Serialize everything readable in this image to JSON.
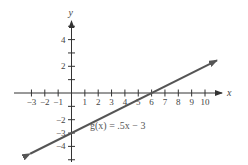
{
  "chart_data": {
    "type": "line",
    "title": "",
    "xlabel": "x",
    "ylabel": "y",
    "xlim": [
      -3.5,
      11.3
    ],
    "ylim": [
      -5.2,
      5.4
    ],
    "grid": false,
    "x_ticks": [
      -3,
      -2,
      -1,
      1,
      2,
      3,
      4,
      5,
      6,
      7,
      8,
      9,
      10
    ],
    "x_tick_labels": [
      "−3",
      "−2",
      "−1",
      "1",
      "2",
      "3",
      "4",
      "5",
      "6",
      "7",
      "8",
      "9",
      "10"
    ],
    "y_ticks": [
      5,
      4,
      3,
      2,
      1,
      -1,
      -2,
      -3,
      -4,
      -5
    ],
    "y_tick_labels": [
      {
        "value": 4,
        "label": "4"
      },
      {
        "value": 2,
        "label": "2"
      },
      {
        "value": -2,
        "label": "−2"
      },
      {
        "value": -3,
        "label": "−3"
      },
      {
        "value": -4,
        "label": "−4"
      }
    ],
    "series": [
      {
        "name": "g(x) = .5x − 3",
        "function": "0.5*x - 3",
        "slope": 0.5,
        "intercept": -3,
        "x": [
          -3.1,
          0,
          6,
          10.9
        ],
        "values": [
          -4.55,
          -3,
          0,
          2.45
        ],
        "color": "#555555",
        "arrows": "both"
      }
    ],
    "annotations": [
      {
        "text": "g(x) = .5x − 3",
        "x": 1.4,
        "y": -2.6
      }
    ]
  },
  "labels": {
    "x_axis": "x",
    "y_axis": "y",
    "equation": "g(x) = .5x − 3"
  }
}
